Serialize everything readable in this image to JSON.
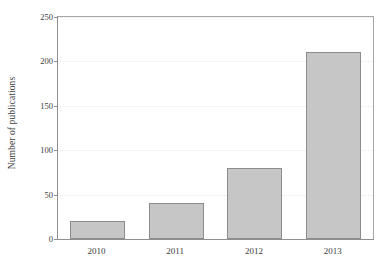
{
  "chart_data": {
    "type": "bar",
    "title": "",
    "xlabel": "",
    "ylabel": "Number of publications",
    "categories": [
      "2010",
      "2011",
      "2012",
      "2013"
    ],
    "values": [
      20,
      40,
      80,
      211
    ],
    "ylim": [
      0,
      250
    ],
    "yticks": [
      0,
      50,
      100,
      150,
      200,
      250
    ],
    "ytick_labels": [
      "0",
      "50",
      "100",
      "150",
      "200",
      "250"
    ],
    "grid": true,
    "grid_axis": "y",
    "legend": null,
    "series": [
      {
        "name": "Number of publications",
        "values": [
          20,
          40,
          80,
          211
        ]
      }
    ],
    "colors": {
      "bar_fill": "#c6c6c6",
      "bar_edge": "#8c8c8c",
      "axis": "#8f8f8f",
      "grid": "#e9e9e9",
      "text": "#3c3c3c",
      "background": "#ffffff"
    }
  }
}
